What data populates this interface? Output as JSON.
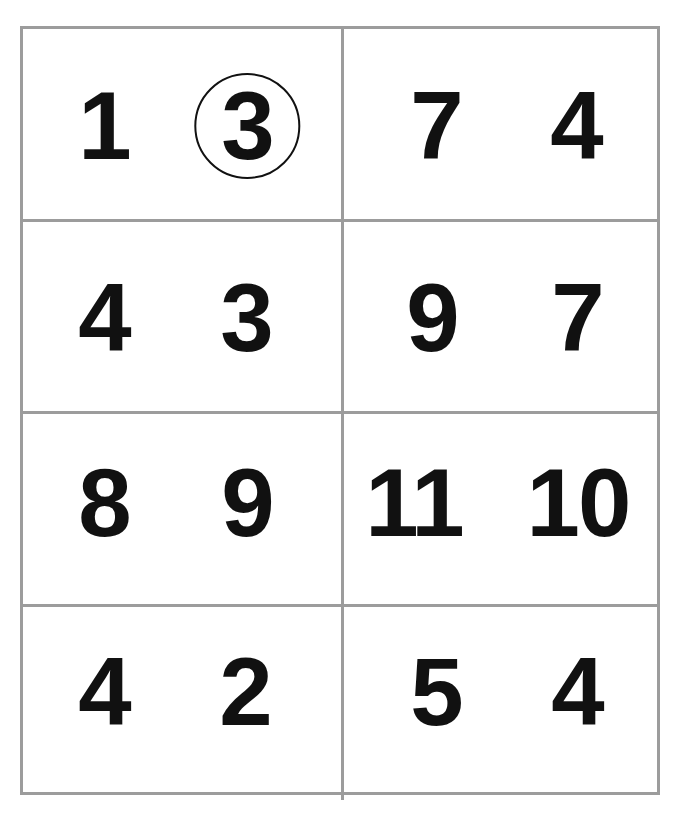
{
  "worksheet": {
    "grid_color": "#9c9c9c",
    "text_color": "#111111",
    "cells": [
      {
        "row": 1,
        "col": 1,
        "numbers": [
          {
            "value": "1",
            "circled": false
          },
          {
            "value": "3",
            "circled": true
          }
        ]
      },
      {
        "row": 1,
        "col": 2,
        "numbers": [
          {
            "value": "7",
            "circled": false
          },
          {
            "value": "4",
            "circled": false
          }
        ]
      },
      {
        "row": 2,
        "col": 1,
        "numbers": [
          {
            "value": "4",
            "circled": false
          },
          {
            "value": "3",
            "circled": false
          }
        ]
      },
      {
        "row": 2,
        "col": 2,
        "numbers": [
          {
            "value": "9",
            "circled": false
          },
          {
            "value": "7",
            "circled": false
          }
        ]
      },
      {
        "row": 3,
        "col": 1,
        "numbers": [
          {
            "value": "8",
            "circled": false
          },
          {
            "value": "9",
            "circled": false
          }
        ]
      },
      {
        "row": 3,
        "col": 2,
        "numbers": [
          {
            "value": "11",
            "circled": false
          },
          {
            "value": "10",
            "circled": false
          }
        ]
      },
      {
        "row": 4,
        "col": 1,
        "numbers": [
          {
            "value": "4",
            "circled": false
          },
          {
            "value": "2",
            "circled": false
          }
        ]
      },
      {
        "row": 4,
        "col": 2,
        "numbers": [
          {
            "value": "5",
            "circled": false
          },
          {
            "value": "4",
            "circled": false
          }
        ]
      }
    ]
  }
}
